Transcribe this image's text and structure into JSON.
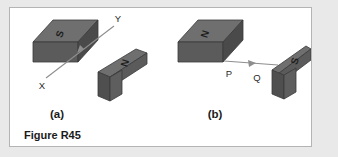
{
  "figure": {
    "caption": "Figure R45",
    "background_color": "#ffffff",
    "page_background_color": "#e9e9e9",
    "border_color": "#b4b4b4"
  },
  "colors": {
    "magnet_top": "#6f6f6f",
    "magnet_front": "#5b5b5b",
    "magnet_side": "#4d4d4d",
    "magnet_edge": "#3a3a3a",
    "arrow": "#8e8e8e",
    "text": "#1b1b1b"
  },
  "panels": [
    {
      "id": "a",
      "label": "(a)",
      "magnets": [
        {
          "name": "left-magnet-a",
          "pole_label": "S",
          "orientation": "horizontal-bar"
        },
        {
          "name": "right-magnet-a",
          "pole_label": "N",
          "orientation": "tilted-bar"
        }
      ],
      "arrow": {
        "name": "arrow-x-to-y",
        "start_label": "X",
        "end_label": "Y",
        "direction": "up-right"
      },
      "point_labels": [
        "X",
        "Y"
      ]
    },
    {
      "id": "b",
      "label": "(b)",
      "magnets": [
        {
          "name": "left-magnet-b",
          "pole_label": "N",
          "orientation": "horizontal-bar"
        },
        {
          "name": "right-magnet-b",
          "pole_label": "S",
          "orientation": "tilted-bar"
        }
      ],
      "arrow": {
        "name": "arrow-p-to-q",
        "start_label": "P",
        "end_label": "Q",
        "direction": "right"
      },
      "point_labels": [
        "P",
        "Q"
      ]
    }
  ]
}
